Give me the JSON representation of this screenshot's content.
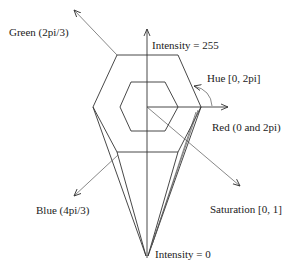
{
  "diagram": {
    "labels": {
      "green": "Green (2pi/3)",
      "intensity_top": "Intensity = 255",
      "hue": "Hue [0, 2pi]",
      "red": "Red (0 and 2pi)",
      "blue": "Blue (4pi/3)",
      "saturation": "Saturation [0, 1]",
      "intensity_bottom": "Intensity = 0"
    },
    "colors": {
      "stroke": "#333333",
      "text": "#222222",
      "background": "#ffffff"
    }
  }
}
